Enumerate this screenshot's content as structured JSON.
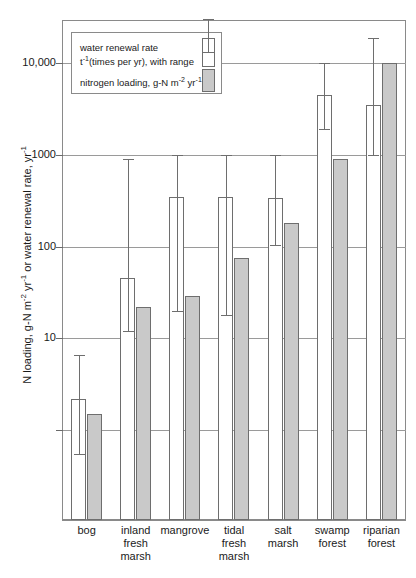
{
  "chart_data": {
    "type": "bar",
    "title": "",
    "xlabel": "",
    "ylabel": "N loading, g-N m^-2 yr^-1 or water renewal rate, yr^-1",
    "yscale": "log",
    "ylim": [
      1,
      30000
    ],
    "ytick_labels": [
      "10,000",
      "1000",
      "100",
      "10"
    ],
    "ytick_values": [
      10000,
      1000,
      100,
      10
    ],
    "grid": "horizontal",
    "legend_position": "upper-left-inside",
    "categories": [
      "bog",
      "inland fresh marsh",
      "mangrove",
      "tidal fresh marsh",
      "salt marsh",
      "swamp forest",
      "riparian forest"
    ],
    "category_label_lines": [
      [
        "bog"
      ],
      [
        "inland",
        "fresh",
        "marsh"
      ],
      [
        "mangrove"
      ],
      [
        "tidal",
        "fresh",
        "marsh"
      ],
      [
        "salt",
        "marsh"
      ],
      [
        "swamp",
        "forest"
      ],
      [
        "riparian",
        "forest"
      ]
    ],
    "series": [
      {
        "name": "water renewal rate",
        "key": "water_renewal_rate",
        "unit": "t^-1 (times per yr), with range",
        "color": "#ffffff",
        "values": [
          2.2,
          45,
          350,
          345,
          340,
          4500,
          3500
        ],
        "range_low": [
          0.55,
          12,
          20,
          18,
          105,
          1900,
          1000
        ],
        "range_high": [
          6.5,
          900,
          1000,
          1000,
          1000,
          10000,
          19000
        ]
      },
      {
        "name": "nitrogen loading",
        "key": "nitrogen_loading",
        "unit": "g-N m^-2 yr^-1",
        "color": "#c9c9c9",
        "values": [
          1.5,
          22,
          29,
          75,
          180,
          900,
          10000
        ]
      }
    ]
  },
  "axis": {
    "y_title_main": "N loading, g-N m",
    "y_title_sup1": "-2",
    "y_title_mid": " yr",
    "y_title_sup2": "-1",
    "y_title_tail": " or water renewal rate, yr",
    "y_title_sup3": "-1"
  },
  "legend": {
    "item1_line1": "water renewal rate",
    "item1_line2_pre": "t",
    "item1_line2_sup": "-1",
    "item1_line2_post": "(times per yr), with range",
    "item2_pre": "nitrogen loading, g-N m",
    "item2_sup1": "-2",
    "item2_mid": " yr",
    "item2_sup2": "-1"
  }
}
